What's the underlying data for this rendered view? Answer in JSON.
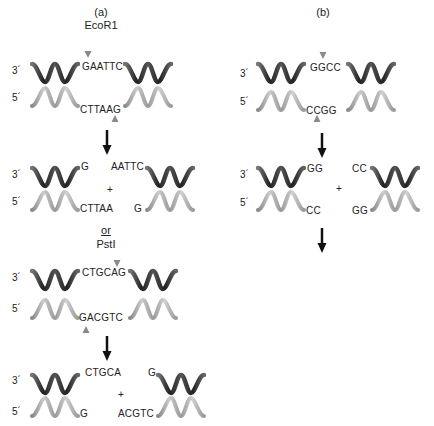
{
  "panel_a": {
    "label": "(a)",
    "enzyme1": "EcoR1",
    "ecor1_site": {
      "top": "GAATTC",
      "bottom": "CTTAAG"
    },
    "ecor1_products": {
      "left_top": "G",
      "left_bottom": "CTTAA",
      "right_top": "AATTC",
      "right_bottom": "G",
      "plus": "+"
    },
    "or_label": "or",
    "enzyme2": "PstI",
    "psti_site": {
      "top": "CTGCAG",
      "bottom": "GACGTC"
    },
    "psti_products": {
      "left_top": "CTGCA",
      "left_bottom": "G",
      "right_top": "G",
      "right_bottom": "ACGTC",
      "plus": "+"
    }
  },
  "panel_b": {
    "label": "(b)",
    "site": {
      "top": "GGCC",
      "bottom": "CCGG"
    },
    "products": {
      "left_top": "GG",
      "left_bottom": "CC",
      "right_top": "CC",
      "right_bottom": "GG",
      "plus": "+"
    }
  },
  "strand_ends": {
    "three_prime": "3´",
    "five_prime": "5´"
  },
  "colors": {
    "top_strand": "#3a3a3a",
    "bottom_strand": "#9a9a9a",
    "cut_marker": "#8a8a8a",
    "arrow": "#111111"
  }
}
